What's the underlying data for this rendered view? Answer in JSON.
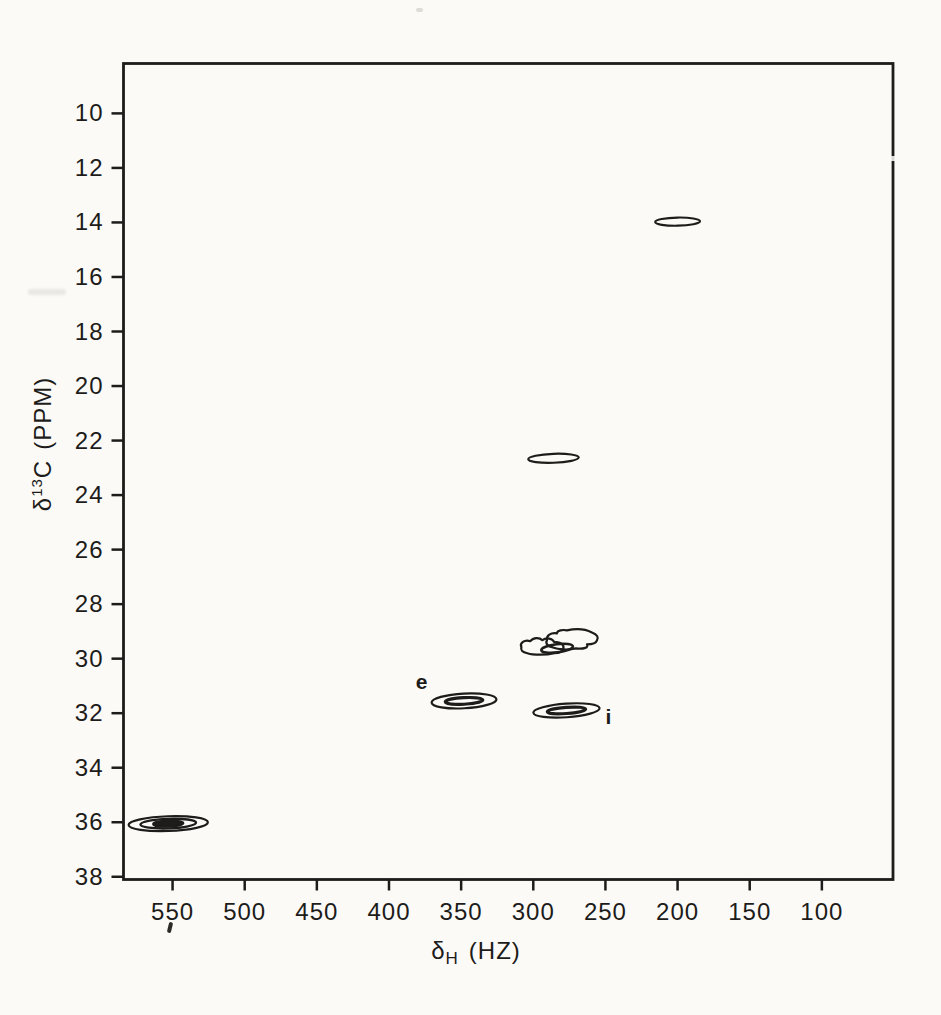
{
  "page": {
    "background": "#fbfaf7",
    "ink": "#1d1c1a"
  },
  "chart_data": {
    "type": "heatmap",
    "subtype": "2D NMR (1H-13C heteronuclear correlation) contour plot, scanned line art",
    "title": "",
    "xlabel": {
      "symbol": "δ",
      "subscript": "H",
      "units": "(HZ)",
      "text": "δH (HZ)"
    },
    "ylabel": {
      "symbol": "δ",
      "superscript": "13",
      "nucleus": "C",
      "units": "(PPM)",
      "text": "δ13C (PPM)"
    },
    "x_axis": {
      "unit": "Hz",
      "direction": "values decrease left to right",
      "ticks": [
        550,
        500,
        450,
        400,
        350,
        300,
        250,
        200,
        150,
        100
      ],
      "edge_left": 584,
      "edge_right": 50.7
    },
    "y_axis": {
      "unit": "ppm",
      "direction": "values increase downward",
      "ticks": [
        10,
        12,
        14,
        16,
        18,
        20,
        22,
        24,
        26,
        28,
        30,
        32,
        34,
        36,
        38
      ],
      "edge_top": 8.17,
      "edge_bottom": 38.1
    },
    "grid": false,
    "legend": null,
    "peaks": [
      {
        "h_hz": 200,
        "c_ppm": 13.97,
        "rx_hz": 15.5,
        "ry_ppm": 0.15,
        "levels": 1,
        "tilt": -1,
        "shape": "ellipse"
      },
      {
        "h_hz": 286,
        "c_ppm": 22.65,
        "rx_hz": 17.5,
        "ry_ppm": 0.165,
        "levels": 1,
        "tilt": -2,
        "shape": "ellipse"
      },
      {
        "h_hz": 272.5,
        "c_ppm": 29.33,
        "rx_hz": 18,
        "ry_ppm": 0.33,
        "levels": 1,
        "tilt": 0,
        "shape": "blob-right"
      },
      {
        "h_hz": 293,
        "c_ppm": 29.58,
        "rx_hz": 15,
        "ry_ppm": 0.27,
        "levels": 1,
        "tilt": 0,
        "shape": "blob-left"
      },
      {
        "h_hz": 283.5,
        "c_ppm": 29.62,
        "rx_hz": 11,
        "ry_ppm": 0.15,
        "levels": 1,
        "tilt": -7,
        "shape": "ellipse",
        "sw": 2.6
      },
      {
        "h_hz": 348,
        "c_ppm": 31.55,
        "rx_hz": 22.5,
        "ry_ppm": 0.27,
        "levels": 2,
        "tilt": -3,
        "shape": "ellipse",
        "assignment": "e"
      },
      {
        "h_hz": 277,
        "c_ppm": 31.9,
        "rx_hz": 23,
        "ry_ppm": 0.25,
        "levels": 2,
        "tilt": -4,
        "shape": "ellipse",
        "assignment": "i"
      },
      {
        "h_hz": 553,
        "c_ppm": 36.05,
        "rx_hz": 27.5,
        "ry_ppm": 0.27,
        "levels": 3,
        "tilt": -2,
        "shape": "ellipse",
        "inner_fill": true
      }
    ],
    "annotations": [
      {
        "text": "e",
        "h_hz": 377,
        "c_ppm": 30.85
      },
      {
        "text": "i",
        "h_hz": 247.5,
        "c_ppm": 32.15
      }
    ]
  }
}
